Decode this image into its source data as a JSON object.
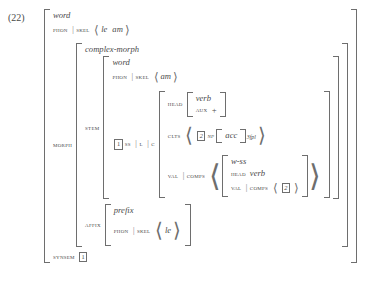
{
  "equation": {
    "number": "(22)"
  },
  "glyphs": {
    "pipe": "|",
    "langle": "⟨",
    "rangle": "⟩",
    "plus": "+"
  },
  "structure": {
    "outer": {
      "type": "word",
      "phon_attr": "PHON",
      "skel_attr": "SKEL",
      "phon_list": [
        "le",
        "am"
      ],
      "morph_attr": "MORPH",
      "synsem_attr": "SYNSEM",
      "synsem_tag": "1"
    },
    "morph": {
      "type": "complex-morph",
      "stem_attr": "STEM",
      "affix_attr": "AFFIX"
    },
    "stem": {
      "type": "word",
      "phon_attr": "PHON",
      "skel_attr": "SKEL",
      "phon_list": [
        "am"
      ],
      "ss_tag": "1",
      "ss_attr": "SS",
      "l_attr": "L",
      "c_attr": "C"
    },
    "category": {
      "head_attr": "HEAD",
      "head_type": "verb",
      "aux_attr": "AUX",
      "aux_value": "+",
      "clts_attr": "CLTS",
      "clts_tag": "2",
      "clts_cat": "NP",
      "clts_case": "acc",
      "clts_index": "3fpl",
      "val_attr": "VAL",
      "comps_attr": "COMPS"
    },
    "comps_element": {
      "type": "w-ss",
      "head_attr": "HEAD",
      "head_type": "verb",
      "val_attr": "VAL",
      "comps_attr": "COMPS",
      "comps_tag": "2"
    },
    "affix": {
      "type": "prefix",
      "phon_attr": "PHON",
      "skel_attr": "SKEL",
      "phon_list": [
        "le"
      ]
    }
  }
}
